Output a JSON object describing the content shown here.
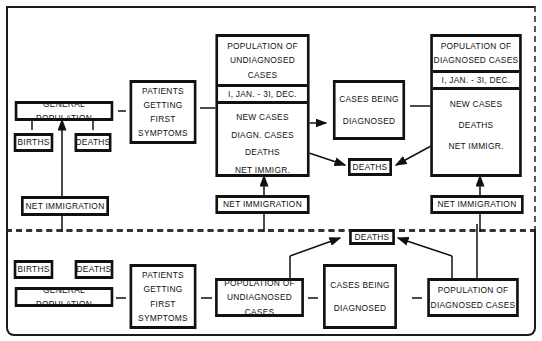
{
  "top_panel": {
    "general_population": "GENERAL POPULATION",
    "births": "BIRTHS",
    "deaths": "DEATHS",
    "net_immigration": "NET IMMIGRATION",
    "patients": [
      "PATIENTS",
      "GETTING FIRST",
      "SYMPTOMS"
    ],
    "undiagnosed": {
      "title": [
        "POPULATION OF",
        "UNDIAGNOSED CASES"
      ],
      "period": "I, JAN. - 3I, DEC.",
      "items": [
        "NEW CASES",
        "DIAGN. CASES",
        "DEATHS",
        "NET IMMIGR."
      ],
      "net_immigration": "NET IMMIGRATION"
    },
    "being_diagnosed": [
      "CASES BEING",
      "DIAGNOSED"
    ],
    "deaths_center": "DEATHS",
    "diagnosed": {
      "title": [
        "POPULATION OF",
        "DIAGNOSED CASES"
      ],
      "period": "I, JAN. - 3I, DEC.",
      "items": [
        "NEW CASES",
        "DEATHS",
        "NET IMMIGR."
      ],
      "net_immigration": "NET IMMIGRATION"
    }
  },
  "bottom_panel": {
    "births": "BIRTHS",
    "deaths": "DEATHS",
    "general_population": "GENERAL POPULATION",
    "patients": [
      "PATIENTS",
      "GETTING FIRST",
      "SYMPTOMS"
    ],
    "undiagnosed": [
      "POPULATION OF",
      "UNDIAGNOSED CASES"
    ],
    "being_diagnosed": [
      "CASES BEING",
      "DIAGNOSED"
    ],
    "diagnosed": [
      "POPULATION OF",
      "DIAGNOSED CASES"
    ],
    "deaths_top": "DEATHS"
  }
}
